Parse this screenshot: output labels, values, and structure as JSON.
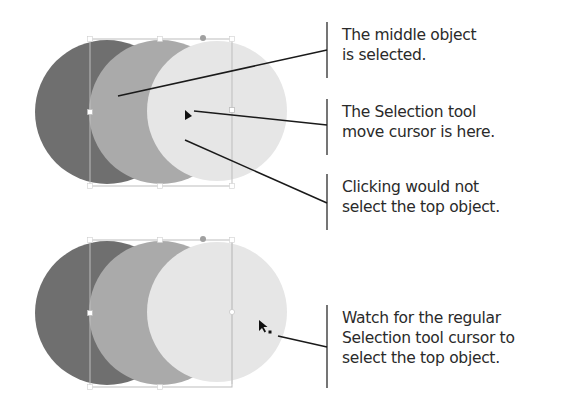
{
  "colors": {
    "bottom_object": "#6f6f6f",
    "middle_object": "#aaaaaa",
    "top_object": "#e6e6e6",
    "selection_box": "#bdbdbd",
    "leader_line": "#1a1a1a",
    "text": "#2a2a2a"
  },
  "figures": [
    {
      "id": "top",
      "state": "middle object selected, move cursor over top object",
      "cursor": "selection-tool-move-cursor"
    },
    {
      "id": "bottom",
      "state": "middle object selected, regular cursor",
      "cursor": "selection-tool-regular-cursor"
    }
  ],
  "callouts": [
    {
      "lines": [
        "The middle object",
        "is selected."
      ]
    },
    {
      "lines": [
        "The Selection tool",
        "move cursor is here."
      ]
    },
    {
      "lines": [
        "Clicking would not",
        "select the top object."
      ]
    },
    {
      "lines": [
        "Watch for the regular",
        "Selection tool cursor to",
        "select the top object."
      ]
    }
  ]
}
